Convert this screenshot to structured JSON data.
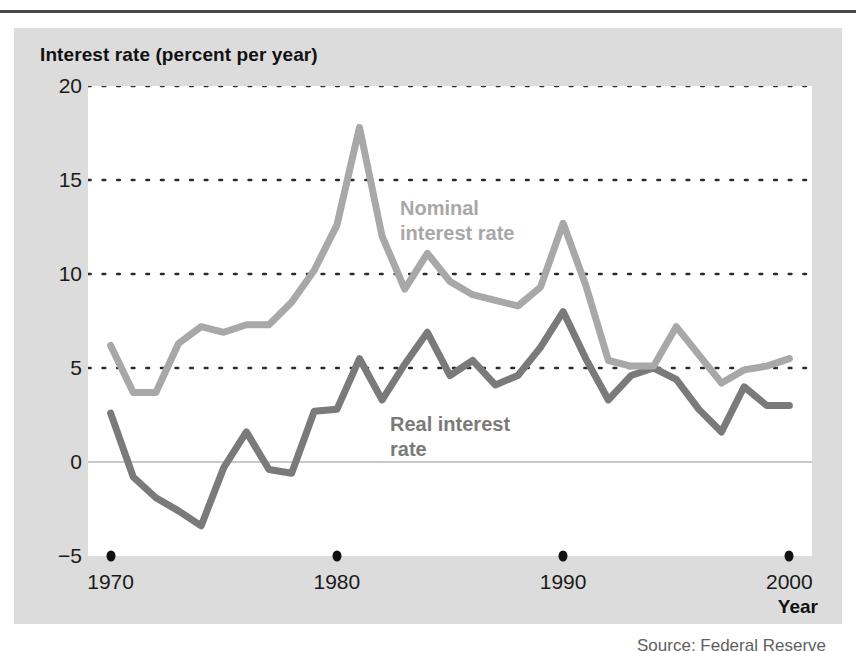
{
  "figure": {
    "axis_title": "Interest rate (percent per year)",
    "x_axis_label": "Year",
    "source": "Source: Federal Reserve"
  },
  "chart_data": {
    "type": "line",
    "title": "Interest rate (percent per year)",
    "xlabel": "Year",
    "ylabel": "Interest rate (percent per year)",
    "xlim": [
      1969,
      2001
    ],
    "ylim": [
      -5,
      20
    ],
    "yticks": [
      20,
      15,
      10,
      5,
      0,
      -5
    ],
    "ytick_labels": [
      "20",
      "15",
      "10",
      "5",
      "0",
      "−5"
    ],
    "xticks": [
      1970,
      1980,
      1990,
      2000
    ],
    "xtick_labels": [
      "1970",
      "1980",
      "1990",
      "2000"
    ],
    "grid": "horizontal-dotted",
    "zero_line": true,
    "legend": "inline-annotations",
    "x": [
      1970,
      1971,
      1972,
      1973,
      1974,
      1975,
      1976,
      1977,
      1978,
      1979,
      1980,
      1981,
      1982,
      1983,
      1984,
      1985,
      1986,
      1987,
      1988,
      1989,
      1990,
      1991,
      1992,
      1993,
      1994,
      1995,
      1996,
      1997,
      1998,
      1999,
      2000
    ],
    "series": [
      {
        "name": "Nominal interest rate",
        "color": "#a8a8a8",
        "annotation": "Nominal\ninterest rate",
        "values": [
          6.2,
          3.7,
          3.7,
          6.3,
          7.2,
          6.9,
          7.3,
          7.3,
          8.5,
          10.2,
          12.6,
          17.8,
          12.0,
          9.2,
          11.1,
          9.6,
          8.9,
          8.6,
          8.3,
          9.3,
          12.7,
          9.4,
          5.4,
          5.1,
          5.1,
          7.2,
          5.7,
          4.2,
          4.9,
          5.1,
          5.5
        ]
      },
      {
        "name": "Real interest rate",
        "color": "#7a7a7a",
        "annotation": "Real interest\nrate",
        "values": [
          2.6,
          -0.8,
          -1.9,
          -2.6,
          -3.4,
          -0.3,
          1.6,
          -0.4,
          -0.6,
          2.7,
          2.8,
          5.5,
          3.3,
          5.2,
          6.9,
          4.6,
          5.4,
          4.1,
          4.6,
          6.1,
          8.0,
          5.5,
          3.3,
          4.6,
          5.0,
          4.4,
          2.8,
          1.6,
          4.0,
          3.0,
          3.0
        ]
      }
    ]
  }
}
